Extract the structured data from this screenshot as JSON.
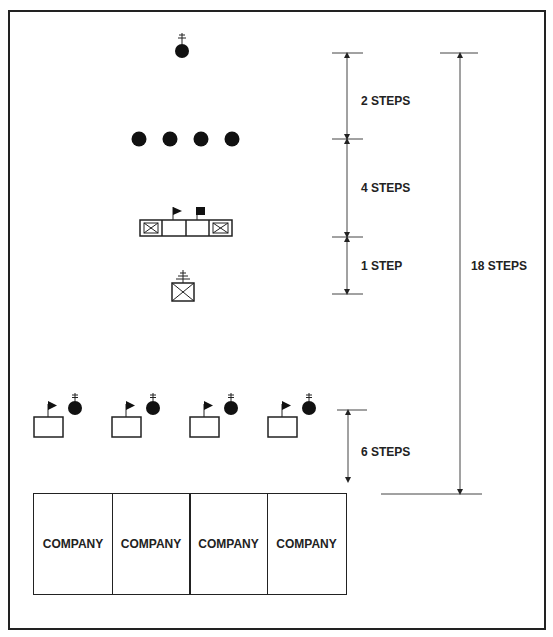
{
  "diagram": {
    "type": "formation-diagram",
    "elements": [
      {
        "row": 1,
        "symbol": "guidon-bearer-with-cross",
        "count": 1
      },
      {
        "row": 2,
        "symbol": "solid-circle",
        "count": 4
      },
      {
        "row": 3,
        "symbol": "headquarters-block-with-flags",
        "count": 1
      },
      {
        "row": 4,
        "symbol": "staff-box-with-cross",
        "count": 1
      },
      {
        "row": 5,
        "symbol": "flag-box-with-circle",
        "count": 4
      },
      {
        "row": 6,
        "symbol": "company-box",
        "count": 4
      }
    ]
  },
  "measurements": {
    "m1": "2 STEPS",
    "m2": "4 STEPS",
    "m3": "1 STEP",
    "m4": "6 STEPS",
    "total": "18 STEPS"
  },
  "companies": [
    {
      "label": "COMPANY"
    },
    {
      "label": "COMPANY"
    },
    {
      "label": "COMPANY"
    },
    {
      "label": "COMPANY"
    }
  ],
  "colors": {
    "ink": "#222222",
    "background": "#ffffff"
  }
}
